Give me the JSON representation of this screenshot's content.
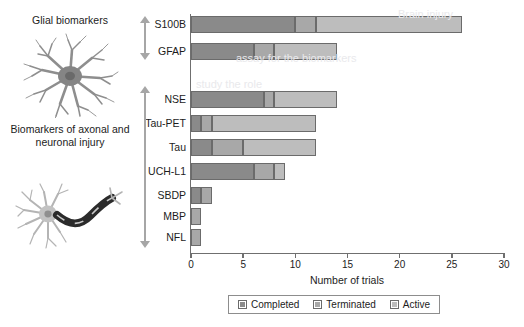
{
  "left_panel": {
    "glial_title": "Glial biomarkers",
    "axonal_title": "Biomarkers of axonal and neuronal injury",
    "astrocyte_icon": "astrocyte-illustration",
    "neuron_icon": "neuron-illustration",
    "group_arrow_icon": "double-headed-arrow-icon"
  },
  "chart_data": {
    "type": "bar",
    "orientation": "horizontal",
    "stacked": true,
    "title": "",
    "xlabel": "Number of trials",
    "ylabel": "",
    "xlim": [
      0,
      30
    ],
    "xticks": [
      0,
      5,
      10,
      15,
      20,
      25,
      30
    ],
    "grid": false,
    "legend_position": "bottom",
    "categories": [
      "S100B",
      "GFAP",
      "NSE",
      "Tau-PET",
      "Tau",
      "UCH-L1",
      "SBDP",
      "MBP",
      "NFL"
    ],
    "series": [
      {
        "name": "Completed",
        "color": "#8a8a8a",
        "values": [
          10,
          6,
          7,
          1,
          2,
          6,
          1,
          0,
          0
        ]
      },
      {
        "name": "Terminated",
        "color": "#a8a8a8",
        "values": [
          2,
          2,
          1,
          1,
          3,
          2,
          1,
          1,
          1
        ]
      },
      {
        "name": "Active",
        "color": "#bdbdbd",
        "values": [
          14,
          6,
          6,
          10,
          7,
          1,
          0,
          0,
          0
        ]
      }
    ],
    "totals": [
      26,
      14,
      14,
      12,
      12,
      9,
      2,
      1,
      1
    ],
    "groups": [
      {
        "label": "Glial biomarkers",
        "categories": [
          "S100B",
          "GFAP"
        ]
      },
      {
        "label": "Biomarkers of axonal and neuronal injury",
        "categories": [
          "NSE",
          "Tau-PET",
          "Tau",
          "UCH-L1",
          "SBDP",
          "MBP",
          "NFL"
        ]
      }
    ]
  },
  "legend": {
    "items": [
      {
        "label": "Completed",
        "icon": "legend-swatch-completed"
      },
      {
        "label": "Terminated",
        "icon": "legend-swatch-terminated"
      },
      {
        "label": "Active",
        "icon": "legend-swatch-active"
      }
    ]
  },
  "ticks": {
    "t0": "0",
    "t1": "5",
    "t2": "10",
    "t3": "15",
    "t4": "20",
    "t5": "25",
    "t6": "30"
  }
}
